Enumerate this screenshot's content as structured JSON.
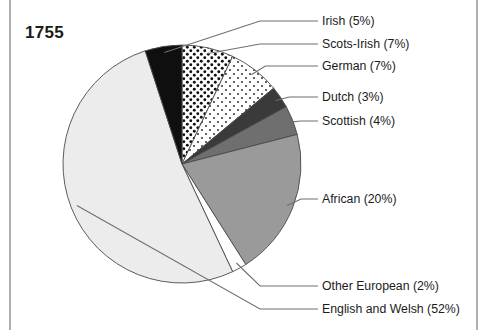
{
  "title": "1755",
  "frame": {
    "left_rule_x": 10,
    "right_rule_x": 477,
    "rule_color": "#8d8d8d"
  },
  "chart_data": {
    "type": "pie",
    "title": "1755",
    "xlabel": "",
    "ylabel": "",
    "unit": "%",
    "legend_position": "right-callouts",
    "grid": false,
    "start_angle_deg": 0,
    "direction": "clockwise",
    "center": [
      182,
      164
    ],
    "radius": 119,
    "categories": [
      "Scots-Irish",
      "German",
      "Dutch",
      "Scottish",
      "African",
      "Other European",
      "English and Welsh",
      "Irish"
    ],
    "values": [
      7,
      7,
      3,
      4,
      20,
      2,
      52,
      5
    ],
    "labels": [
      "Scots-Irish (7%)",
      "German (7%)",
      "Dutch (3%)",
      "Scottish (4%)",
      "African (20%)",
      "Other European (2%)",
      "English and Welsh (52%)",
      "Irish (5%)"
    ],
    "slices": [
      {
        "name": "Scots-Irish",
        "label": "Scots-Irish (7%)",
        "value": 7,
        "fill": "dense-dots",
        "color": "#ffffff",
        "pattern_color": "#111111",
        "callout_y": 44,
        "callout_x": 322
      },
      {
        "name": "German",
        "label": "German (7%)",
        "value": 7,
        "fill": "sparse-dots",
        "color": "#ffffff",
        "pattern_color": "#222222",
        "callout_y": 66,
        "callout_x": 322
      },
      {
        "name": "Dutch",
        "label": "Dutch (3%)",
        "value": 3,
        "fill": "solid",
        "color": "#3a3a3a",
        "callout_y": 97,
        "callout_x": 322
      },
      {
        "name": "Scottish",
        "label": "Scottish (4%)",
        "value": 4,
        "fill": "solid",
        "color": "#6f6f6f",
        "callout_y": 121,
        "callout_x": 322
      },
      {
        "name": "African",
        "label": "African (20%)",
        "value": 20,
        "fill": "solid",
        "color": "#9a9a9a",
        "callout_y": 199,
        "callout_x": 322
      },
      {
        "name": "Other European",
        "label": "Other European (2%)",
        "value": 2,
        "fill": "solid",
        "color": "#ffffff",
        "callout_y": 286,
        "callout_x": 322
      },
      {
        "name": "English and Welsh",
        "label": "English and Welsh (52%)",
        "value": 52,
        "fill": "solid",
        "color": "#ececec",
        "callout_y": 309,
        "callout_x": 322
      },
      {
        "name": "Irish",
        "label": "Irish (5%)",
        "value": 5,
        "fill": "solid",
        "color": "#0f0f0f",
        "callout_y": 21,
        "callout_x": 322
      }
    ]
  }
}
